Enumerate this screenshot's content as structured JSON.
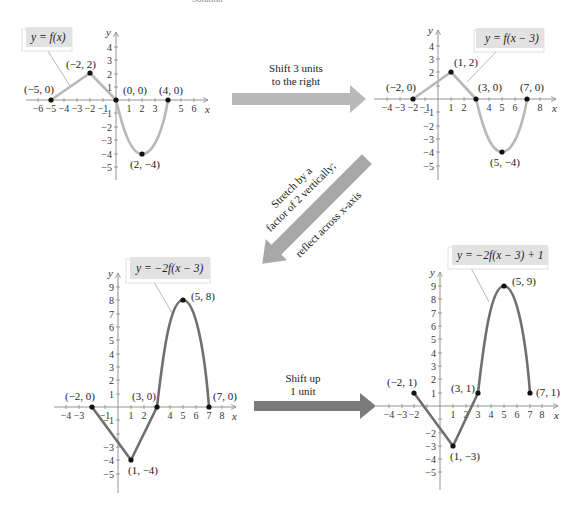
{
  "caption": "Solution",
  "colors": {
    "curve_light": "#b8b8b8",
    "curve_dark": "#6f6f6f",
    "axis": "#888888",
    "label_box": "#e2e2e2",
    "arrow_light": "#b9b9b9",
    "arrow_mid": "#a8a8a8",
    "arrow_dark": "#7a7a7a",
    "point": "#111111"
  },
  "arrows": {
    "shift_right": {
      "line1": "Shift 3 units",
      "line2": "to the right"
    },
    "stretch": {
      "line1": "Stretch by a",
      "line2": "factor of 2 vertically;",
      "line3": "reflect across x-axis"
    },
    "shift_up": {
      "line1": "Shift up",
      "line2": "1 unit"
    }
  },
  "graphs": {
    "g1": {
      "label": "y = f(x)",
      "points": [
        {
          "x": -5,
          "y": 0,
          "text": "(−5, 0)"
        },
        {
          "x": -2,
          "y": 2,
          "text": "(−2, 2)"
        },
        {
          "x": 0,
          "y": 0,
          "text": "(0, 0)"
        },
        {
          "x": 2,
          "y": -4,
          "text": "(2, −4)"
        },
        {
          "x": 4,
          "y": 0,
          "text": "(4, 0)"
        }
      ],
      "xticks": [
        "−6",
        "−5",
        "−4",
        "−3",
        "−2",
        "−1",
        "1",
        "2",
        "3",
        "5",
        "6"
      ],
      "yticks": [
        "4",
        "3",
        "2",
        "1",
        "−1",
        "−2",
        "−3",
        "−4",
        "−5"
      ]
    },
    "g2": {
      "label": "y = f(x − 3)",
      "points": [
        {
          "x": -2,
          "y": 0,
          "text": "(−2, 0)"
        },
        {
          "x": 1,
          "y": 2,
          "text": "(1, 2)"
        },
        {
          "x": 3,
          "y": 0,
          "text": "(3, 0)"
        },
        {
          "x": 5,
          "y": -4,
          "text": "(5, −4)"
        },
        {
          "x": 7,
          "y": 0,
          "text": "(7, 0)"
        }
      ],
      "xticks": [
        "−4",
        "−3",
        "−2",
        "−1",
        "1",
        "2",
        "4",
        "5",
        "6",
        "8"
      ],
      "yticks": [
        "4",
        "3",
        "2",
        "−1",
        "−2",
        "−3",
        "−4",
        "−5"
      ]
    },
    "g3": {
      "label": "y = −2f(x − 3)",
      "points": [
        {
          "x": -2,
          "y": 0,
          "text": "(−2, 0)"
        },
        {
          "x": 1,
          "y": -4,
          "text": "(1, −4)"
        },
        {
          "x": 3,
          "y": 0,
          "text": "(3, 0)"
        },
        {
          "x": 5,
          "y": 8,
          "text": "(5, 8)"
        },
        {
          "x": 7,
          "y": 0,
          "text": "(7, 0)"
        }
      ],
      "xticks": [
        "−4",
        "−3",
        "−1",
        "1",
        "2",
        "4",
        "5",
        "6",
        "7",
        "8"
      ],
      "yticks": [
        "9",
        "8",
        "7",
        "6",
        "5",
        "4",
        "3",
        "2",
        "1",
        "−1",
        "−3",
        "−4",
        "−5"
      ]
    },
    "g4": {
      "label": "y = −2f(x − 3) + 1",
      "points": [
        {
          "x": -2,
          "y": 1,
          "text": "(−2, 1)"
        },
        {
          "x": 1,
          "y": -3,
          "text": "(1, −3)"
        },
        {
          "x": 3,
          "y": 1,
          "text": "(3, 1)"
        },
        {
          "x": 5,
          "y": 9,
          "text": "(5, 9)"
        },
        {
          "x": 7,
          "y": 1,
          "text": "(7, 1)"
        }
      ],
      "xticks": [
        "−4",
        "−3",
        "−2",
        "1",
        "2",
        "3",
        "4",
        "5",
        "6",
        "7",
        "8"
      ],
      "yticks": [
        "9",
        "8",
        "7",
        "6",
        "5",
        "4",
        "3",
        "2",
        "1",
        "−2",
        "−3",
        "−4",
        "−5"
      ]
    },
    "axis_x": "x",
    "axis_y": "y"
  }
}
